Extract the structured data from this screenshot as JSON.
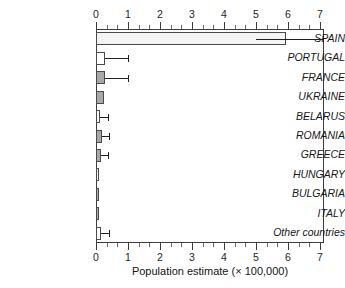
{
  "chart_data": {
    "type": "bar",
    "orientation": "horizontal",
    "title": "",
    "xlabel": "Population estimate (× 100,000)",
    "ylabel": "",
    "xlim": [
      0,
      7.125
    ],
    "xticks": [
      0,
      1,
      2,
      3,
      4,
      5,
      6,
      7
    ],
    "xticklabels": [
      "0",
      "1",
      "2",
      "3",
      "4",
      "5",
      "6",
      "7"
    ],
    "minor_ticks_per_interval": 2,
    "grid": false,
    "legend": null,
    "axes": [
      "top",
      "bottom"
    ],
    "categories": [
      "SPAIN",
      "PORTUGAL",
      "FRANCE",
      "UKRAINE",
      "BELARUS",
      "ROMANIA",
      "GREECE",
      "HUNGARY",
      "BULGARIA",
      "ITALY",
      "Other countries"
    ],
    "values": [
      5.95,
      0.28,
      0.28,
      0.25,
      0.12,
      0.19,
      0.17,
      0.1,
      0.1,
      0.1,
      0.16
    ],
    "errors_low": [
      5.0,
      0.28,
      0.28,
      null,
      0.12,
      0.19,
      0.17,
      null,
      null,
      null,
      0.16
    ],
    "errors_high": [
      7.1,
      1.0,
      1.0,
      null,
      0.38,
      0.42,
      0.38,
      null,
      null,
      null,
      0.4
    ],
    "bar_fills": [
      "pale",
      "white",
      "gray",
      "gray",
      "white",
      "gray",
      "gray",
      "white",
      "gray",
      "gray",
      "white"
    ],
    "colors": {
      "bar_gray": "#a8a8a8",
      "bar_white": "#ffffff",
      "bar_pale": "#f4f4f4",
      "bar_edge": "#4a4a4a",
      "axis": "#3d3d3d",
      "error": "#202020",
      "text": "#161616"
    }
  }
}
